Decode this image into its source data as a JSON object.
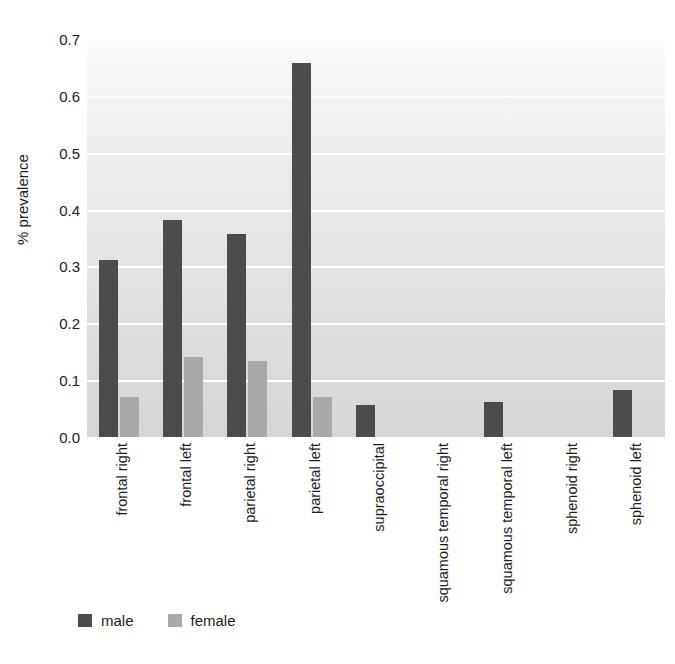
{
  "chart_data": {
    "type": "bar",
    "title": "",
    "xlabel": "",
    "ylabel": "% prevalence",
    "ylim": [
      0.0,
      0.7
    ],
    "yticks": [
      "0.0",
      "0.1",
      "0.2",
      "0.3",
      "0.4",
      "0.5",
      "0.6",
      "0.7"
    ],
    "ytick_values": [
      0.0,
      0.1,
      0.2,
      0.3,
      0.4,
      0.5,
      0.6,
      0.7
    ],
    "grid": "horizontal-white-gridlines",
    "legend_position": "bottom-left",
    "categories": [
      "frontal right",
      "frontal left",
      "parietal right",
      "parietal left",
      "supraoccipital",
      "squamous temporal right",
      "squamous temporal left",
      "sphenoid right",
      "sphenoid left"
    ],
    "series": [
      {
        "name": "male",
        "color": "#4c4c4c",
        "values": [
          0.312,
          0.382,
          0.357,
          0.658,
          0.056,
          0.0,
          0.062,
          0.0,
          0.082
        ]
      },
      {
        "name": "female",
        "color": "#a9a9a9",
        "values": [
          0.07,
          0.141,
          0.133,
          0.07,
          0.0,
          0.0,
          0.0,
          0.0,
          0.0
        ]
      }
    ]
  },
  "axes": {
    "y_title": "% prevalence"
  },
  "legend": {
    "entries": [
      {
        "label": "male",
        "color": "#4c4c4c"
      },
      {
        "label": "female",
        "color": "#a9a9a9"
      }
    ]
  }
}
